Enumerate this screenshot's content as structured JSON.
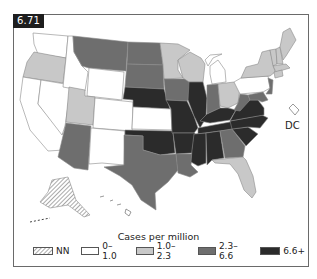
{
  "badge": {
    "label": "6.71"
  },
  "map": {
    "dc_label": "DC",
    "colors": {
      "nn": "hatch",
      "c0": "#ffffff",
      "c1": "#c8c8c8",
      "c2": "#6e6e6e",
      "c3": "#2b2b2b",
      "border": "#8a8a8a"
    }
  },
  "legend": {
    "title": "Cases per million",
    "items": [
      {
        "label": "NN",
        "swatch": "hatch"
      },
      {
        "label": "0–1.0",
        "swatch": "#ffffff"
      },
      {
        "label": "1.0–2.3",
        "swatch": "#c8c8c8"
      },
      {
        "label": "2.3–6.6",
        "swatch": "#6e6e6e"
      },
      {
        "label": "6.6+",
        "swatch": "#2b2b2b"
      }
    ]
  }
}
